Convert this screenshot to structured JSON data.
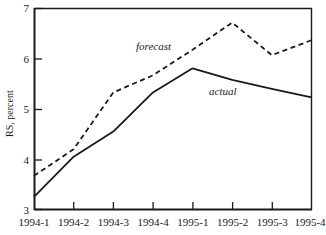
{
  "chart_data": {
    "type": "line",
    "title": "",
    "xlabel": "",
    "ylabel": "RS, percent",
    "categories": [
      "1994-1",
      "1994-2",
      "1994-3",
      "1994-4",
      "1995-1",
      "1995-2",
      "1995-3",
      "1995-4"
    ],
    "ylim": [
      3,
      7
    ],
    "ytick_labels": [
      "3",
      "4",
      "5",
      "6",
      "7"
    ],
    "yticks": [
      3,
      4,
      5,
      6,
      7
    ],
    "grid": false,
    "legend_position": "inline-annotation",
    "series": [
      {
        "name": "forecast",
        "style": "dashed",
        "color": "#1a1a1a",
        "values": [
          3.67,
          4.2,
          5.33,
          5.67,
          6.18,
          6.72,
          6.07,
          6.37
        ]
      },
      {
        "name": "actual",
        "style": "solid",
        "color": "#1a1a1a",
        "values": [
          3.25,
          4.05,
          4.55,
          5.33,
          5.81,
          5.58,
          5.4,
          5.23
        ]
      }
    ],
    "annotations": [
      {
        "text": "forecast",
        "x_value": "1994-4",
        "y_value": 6.25
      },
      {
        "text": "actual",
        "x_value": "1995-2",
        "y_value": 5.42
      }
    ]
  },
  "axis": {
    "y_title": "RS, percent",
    "y_tick_3": "3",
    "y_tick_4": "4",
    "y_tick_5": "5",
    "y_tick_6": "6",
    "y_tick_7": "7",
    "x_tick_0": "1994-1",
    "x_tick_1": "1994-2",
    "x_tick_2": "1994-3",
    "x_tick_3": "1994-4",
    "x_tick_4": "1995-1",
    "x_tick_5": "1995-2",
    "x_tick_6": "1995-3",
    "x_tick_7": "1995-4"
  },
  "labels": {
    "forecast": "forecast",
    "actual": "actual"
  }
}
